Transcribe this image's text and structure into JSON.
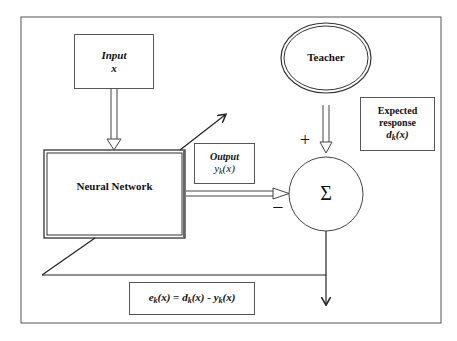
{
  "diagram": {
    "type": "supervised-learning-block-diagram",
    "nodes": {
      "input": {
        "title": "Input",
        "symbol": "x"
      },
      "teacher": {
        "label": "Teacher"
      },
      "expected": {
        "line1": "Expected",
        "line2": "response",
        "symbol_main": "d",
        "symbol_sub": "k",
        "symbol_arg": "(x)"
      },
      "neural_network": {
        "label": "Neural Network"
      },
      "output": {
        "title": "Output",
        "symbol_main": "y",
        "symbol_sub": "k",
        "symbol_arg": "(x)"
      },
      "summation": {
        "symbol": "Σ",
        "plus_sign": "+",
        "minus_sign": "−"
      },
      "error": {
        "e": "e",
        "e_sub": "k",
        "e_arg": "(x)",
        "eq": " = ",
        "d": "d",
        "d_sub": "k",
        "d_arg": "(x)",
        "minus": " - ",
        "y": "y",
        "y_sub": "k",
        "y_arg": "(x)"
      }
    },
    "edges": [
      {
        "from": "input",
        "to": "neural_network",
        "style": "double-arrow"
      },
      {
        "from": "teacher",
        "to": "summation",
        "style": "double-arrow",
        "sign": "+"
      },
      {
        "from": "neural_network",
        "to": "summation",
        "style": "double-arrow",
        "sign": "−"
      },
      {
        "from": "summation",
        "to": "error",
        "style": "line-arrow"
      },
      {
        "from": "error-feedback",
        "to": "neural_network",
        "style": "diagonal-adjust-arrow"
      }
    ],
    "colors": {
      "stroke": "#333333",
      "background": "#ffffff",
      "text": "#111111"
    }
  }
}
